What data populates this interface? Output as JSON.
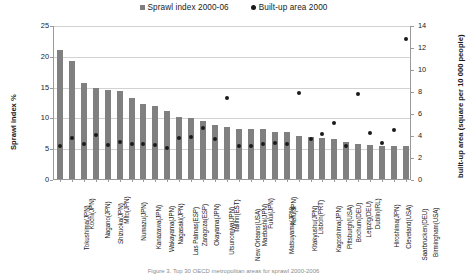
{
  "legend": {
    "items": [
      {
        "label": "Sprawl index 2000-06",
        "marker": "square-marker",
        "color": "#7f7f7f"
      },
      {
        "label": "Built-up area 2000",
        "marker": "circle-marker",
        "color": "#1a1a1a"
      }
    ]
  },
  "axes": {
    "y_left_title": "Sprawl index %",
    "y_right_title": "built-up area (square per 10 000 people)",
    "y_left_ticks": [
      "25",
      "20",
      "15",
      "10",
      "5",
      "0"
    ],
    "y_right_ticks": [
      "14",
      "12",
      "10",
      "8",
      "6",
      "4",
      "2",
      "0"
    ]
  },
  "caption": "Figure 3. Top 30 OECD metropolitan areas for sprawl 2000-2006",
  "chart_data": {
    "type": "bar",
    "title": "",
    "xlabel": "",
    "ylabel": "Sprawl index %",
    "ylim": [
      0,
      25
    ],
    "y2label": "built-up area (square per 10 000 people)",
    "y2lim": [
      0,
      14
    ],
    "grid": true,
    "legend_position": "top-center",
    "categories": [
      "Tokushima(JPN)",
      "Kochi(JPN)",
      "Nagano(JPN)",
      "Shizuoka(JPN)",
      "Mito(JPN)",
      "Numazu(JPN)",
      "Kanazawa(JPN)",
      "Wakayama(JPN)",
      "Nagasaki(JPN)",
      "Las Palmas(ESP)",
      "Zaragoza(ESP)",
      "Okayama(JPN)",
      "Utsunomiya(JPN)",
      "Tallinn(EST)",
      "New Orleans(USA)",
      "Maebashi(JPN)",
      "Fukui(JPN)",
      "Matsuyama(JPN)",
      "Kofu(JPN)",
      "Kitakyushu(JPN)",
      "Lisbon(PRT)",
      "Kagoshima(JPN)",
      "Pittsburgh(USA)",
      "Bochum(DEU)",
      "Leipzig(DEU)",
      "Dublin(IRL)",
      "Hiroshima(JPN)",
      "Cleveland(USA)",
      "Saarbrucken(DEU)",
      "Birmingham(USA)"
    ],
    "series": [
      {
        "name": "Sprawl index 2000-06",
        "axis": "left",
        "type": "bar",
        "color": "#808080",
        "values": [
          20.9,
          19.2,
          15.6,
          14.8,
          14.4,
          14.3,
          13.1,
          12.2,
          11.9,
          11.0,
          10.0,
          9.9,
          9.4,
          8.7,
          8.4,
          8.2,
          8.1,
          8.1,
          7.6,
          7.6,
          7.0,
          6.8,
          6.6,
          6.5,
          6.0,
          5.7,
          5.6,
          5.4,
          5.4,
          5.3
        ]
      },
      {
        "name": "Built-up area 2000",
        "axis": "right",
        "type": "scatter",
        "color": "#1a1a1a",
        "values": [
          3.0,
          3.7,
          3.2,
          4.0,
          3.1,
          3.4,
          3.2,
          3.2,
          3.1,
          2.8,
          3.7,
          3.8,
          4.6,
          3.6,
          7.4,
          3.0,
          3.0,
          3.2,
          3.3,
          3.2,
          7.8,
          3.6,
          4.1,
          5.1,
          3.0,
          7.7,
          4.2,
          3.3,
          4.5,
          12.7
        ]
      }
    ]
  }
}
